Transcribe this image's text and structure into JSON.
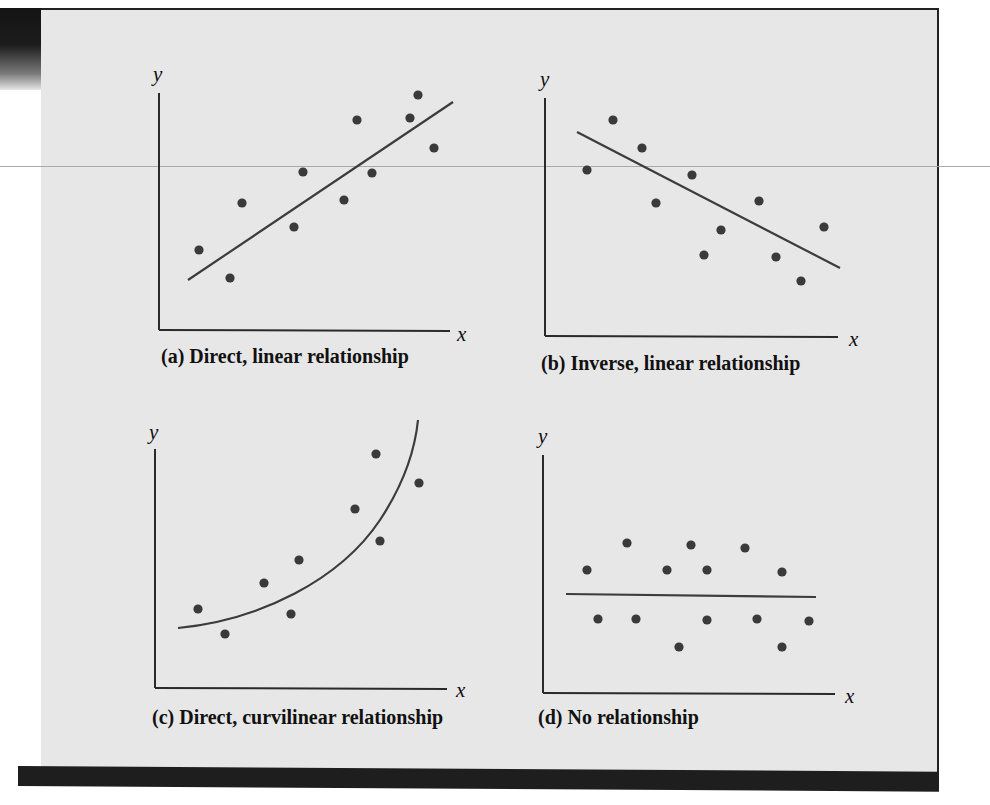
{
  "figure": {
    "panel_color": "#e7e7e7",
    "ink_color": "#2a2a2a",
    "point_color": "#3a3a3a"
  },
  "chart_data": [
    {
      "id": "a",
      "type": "scatter",
      "title": "(a) Direct, linear relationship",
      "xlabel": "x",
      "ylabel": "y",
      "grid": false,
      "ticks": false,
      "fit": {
        "kind": "linear",
        "direction": "positive",
        "from": [
          0.1,
          0.21
        ],
        "to": [
          1.0,
          0.96
        ]
      },
      "points": [
        [
          0.14,
          0.34
        ],
        [
          0.24,
          0.22
        ],
        [
          0.28,
          0.54
        ],
        [
          0.49,
          0.67
        ],
        [
          0.46,
          0.44
        ],
        [
          0.68,
          0.89
        ],
        [
          0.63,
          0.55
        ],
        [
          0.73,
          0.67
        ],
        [
          0.86,
          0.89
        ],
        [
          0.89,
          0.99
        ],
        [
          0.94,
          0.77
        ]
      ],
      "pixel": {
        "origin": [
          159,
          330
        ],
        "x_end": 450,
        "y_top": 93,
        "y_label_pos": [
          153,
          62
        ],
        "x_label_pos": [
          457,
          322
        ],
        "caption_pos": [
          161,
          345
        ],
        "line": [
          [
            188,
            280
          ],
          [
            453,
            102
          ]
        ],
        "points": [
          [
            199,
            250
          ],
          [
            230,
            278
          ],
          [
            242,
            203
          ],
          [
            303,
            172
          ],
          [
            294,
            227
          ],
          [
            357,
            120
          ],
          [
            344,
            200
          ],
          [
            372,
            173
          ],
          [
            410,
            118
          ],
          [
            418,
            95
          ],
          [
            434,
            148
          ]
        ]
      }
    },
    {
      "id": "b",
      "type": "scatter",
      "title": "(b) Inverse, linear relationship",
      "xlabel": "x",
      "ylabel": "y",
      "grid": false,
      "ticks": false,
      "fit": {
        "kind": "linear",
        "direction": "negative",
        "from": [
          0.11,
          0.86
        ],
        "to": [
          1.0,
          0.29
        ]
      },
      "points": [
        [
          0.14,
          0.7
        ],
        [
          0.23,
          0.91
        ],
        [
          0.33,
          0.79
        ],
        [
          0.38,
          0.56
        ],
        [
          0.5,
          0.68
        ],
        [
          0.6,
          0.45
        ],
        [
          0.54,
          0.34
        ],
        [
          0.73,
          0.57
        ],
        [
          0.79,
          0.33
        ],
        [
          0.87,
          0.23
        ],
        [
          0.95,
          0.46
        ]
      ],
      "pixel": {
        "origin": [
          545,
          336
        ],
        "x_end": 838,
        "y_top": 98,
        "y_label_pos": [
          540,
          67
        ],
        "x_label_pos": [
          849,
          327
        ],
        "caption_pos": [
          541,
          352
        ],
        "line": [
          [
            577,
            132
          ],
          [
            840,
            268
          ]
        ],
        "points": [
          [
            587,
            170
          ],
          [
            613,
            120
          ],
          [
            642,
            148
          ],
          [
            656,
            203
          ],
          [
            692,
            175
          ],
          [
            721,
            230
          ],
          [
            704,
            255
          ],
          [
            759,
            201
          ],
          [
            776,
            257
          ],
          [
            801,
            281
          ],
          [
            824,
            227
          ]
        ]
      }
    },
    {
      "id": "c",
      "type": "scatter",
      "title": "(c) Direct, curvilinear relationship",
      "xlabel": "x",
      "ylabel": "y",
      "grid": false,
      "ticks": false,
      "fit": {
        "kind": "curvilinear",
        "direction": "positive, increasing slope"
      },
      "points": [
        [
          0.15,
          0.33
        ],
        [
          0.24,
          0.22
        ],
        [
          0.37,
          0.44
        ],
        [
          0.49,
          0.54
        ],
        [
          0.46,
          0.31
        ],
        [
          0.69,
          0.75
        ],
        [
          0.76,
          0.98
        ],
        [
          0.77,
          0.61
        ],
        [
          0.9,
          0.86
        ]
      ],
      "pixel": {
        "origin": [
          155,
          688
        ],
        "x_end": 447,
        "y_top": 449,
        "y_label_pos": [
          149,
          420
        ],
        "x_label_pos": [
          456,
          678
        ],
        "caption_pos": [
          152,
          706
        ],
        "curve": "M 178 628 C 260 620, 340 580, 380 520 C 405 482, 415 450, 418 420",
        "points": [
          [
            198,
            609
          ],
          [
            225,
            634
          ],
          [
            264,
            583
          ],
          [
            299,
            560
          ],
          [
            291,
            614
          ],
          [
            355,
            509
          ],
          [
            376,
            454
          ],
          [
            380,
            541
          ],
          [
            419,
            483
          ]
        ]
      }
    },
    {
      "id": "d",
      "type": "scatter",
      "title": "(d) No relationship",
      "xlabel": "x",
      "ylabel": "y",
      "grid": false,
      "ticks": false,
      "fit": {
        "kind": "linear",
        "direction": "flat",
        "from": [
          0.08,
          0.41
        ],
        "to": [
          0.94,
          0.41
        ]
      },
      "points": [
        [
          0.15,
          0.51
        ],
        [
          0.19,
          0.31
        ],
        [
          0.29,
          0.62
        ],
        [
          0.32,
          0.31
        ],
        [
          0.42,
          0.51
        ],
        [
          0.47,
          0.19
        ],
        [
          0.51,
          0.62
        ],
        [
          0.56,
          0.51
        ],
        [
          0.56,
          0.31
        ],
        [
          0.69,
          0.6
        ],
        [
          0.73,
          0.31
        ],
        [
          0.82,
          0.51
        ],
        [
          0.82,
          0.19
        ],
        [
          0.91,
          0.3
        ]
      ],
      "pixel": {
        "origin": [
          543,
          693
        ],
        "x_end": 835,
        "y_top": 455,
        "y_label_pos": [
          538,
          424
        ],
        "x_label_pos": [
          845,
          684
        ],
        "caption_pos": [
          538,
          706
        ],
        "line": [
          [
            566,
            594
          ],
          [
            816,
            597
          ]
        ],
        "points": [
          [
            587,
            570
          ],
          [
            598,
            619
          ],
          [
            627,
            543
          ],
          [
            636,
            619
          ],
          [
            667,
            570
          ],
          [
            679,
            647
          ],
          [
            691,
            545
          ],
          [
            707,
            570
          ],
          [
            707,
            620
          ],
          [
            745,
            548
          ],
          [
            757,
            619
          ],
          [
            782,
            572
          ],
          [
            782,
            647
          ],
          [
            809,
            621
          ]
        ]
      }
    }
  ]
}
